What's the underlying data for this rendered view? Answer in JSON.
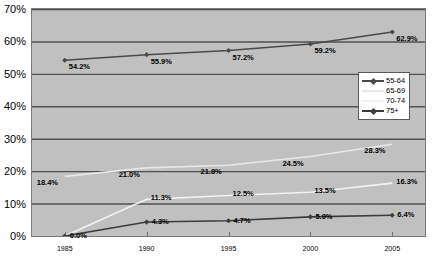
{
  "chart_data": {
    "type": "line",
    "title": "",
    "subtitle": "",
    "xlabel": "",
    "ylabel": "",
    "categories": [
      "1985",
      "1990",
      "1995",
      "2000",
      "2005"
    ],
    "x": [
      1985,
      1990,
      1995,
      2000,
      2005
    ],
    "xlim": [
      1983,
      2007
    ],
    "ylim": [
      0,
      70
    ],
    "y_tick_labels": [
      "70%",
      "60%",
      "50%",
      "40%",
      "30%",
      "20%",
      "10%",
      "0%"
    ],
    "y_tick_values": [
      70,
      60,
      50,
      40,
      30,
      20,
      10,
      0
    ],
    "x_tick_labels": [
      "1985",
      "1990",
      "1995",
      "2000",
      "2005"
    ],
    "grid": "horizontal",
    "legend_position": "inside-center-right",
    "plot_background": "#c0c0c0",
    "gridline_color": "#505050",
    "series": [
      {
        "name": "55-64",
        "color": "#4a4a4a",
        "marker": "diamond",
        "values": [
          54.2,
          55.9,
          57.2,
          59.2,
          62.9
        ],
        "labels": [
          "54.2%",
          "55.9%",
          "57.2%",
          "59.2%",
          "62.9%"
        ]
      },
      {
        "name": "65-69",
        "color": "#e8e8e8",
        "marker": "none",
        "values": [
          18.4,
          21.0,
          21.8,
          24.5,
          28.3
        ],
        "labels": [
          "18.4%",
          "21.0%",
          "21.8%",
          "24.5%",
          "28.3%"
        ]
      },
      {
        "name": "70-74",
        "color": "#f2f2f2",
        "marker": "none",
        "values": [
          0.0,
          11.3,
          12.5,
          13.5,
          16.3
        ],
        "labels": [
          "",
          "11.3%",
          "12.5%",
          "13.5%",
          "16.3%"
        ]
      },
      {
        "name": "75+",
        "color": "#3c3c3c",
        "marker": "diamond",
        "values": [
          0.0,
          4.3,
          4.7,
          5.9,
          6.4
        ],
        "labels": [
          "0.0%",
          "4.3%",
          "4.7%",
          "5.9%",
          "6.4%"
        ]
      }
    ],
    "legend_entries": [
      {
        "label": "55-64",
        "color": "#4a4a4a",
        "marker": "diamond"
      },
      {
        "label": "65-69",
        "color": "#e8e8e8",
        "marker": "none"
      },
      {
        "label": "70-74",
        "color": "#f2f2f2",
        "marker": "none"
      },
      {
        "label": "75+",
        "color": "#3c3c3c",
        "marker": "diamond"
      }
    ]
  }
}
